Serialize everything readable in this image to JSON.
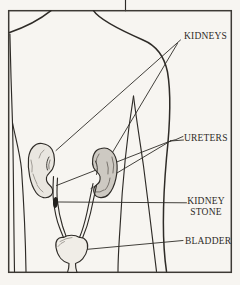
{
  "labels": {
    "kidneys": "KIDNEYS",
    "ureters": "URETERS",
    "kidney_stone_line1": "KIDNEY",
    "kidney_stone_line2": "STONE",
    "bladder": "BLADDER"
  },
  "colors": {
    "ink": "#2e2b27",
    "paper": "#f7f5f1"
  }
}
